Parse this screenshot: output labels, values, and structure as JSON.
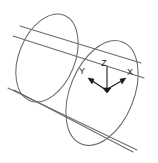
{
  "figure": {
    "background_color": "#ffffff",
    "outline_color": "#6b6b6b",
    "axis_color": "#1a1a1a",
    "width": 158,
    "height": 163
  },
  "axes": {
    "origin_label": "",
    "z": {
      "label": "Z",
      "label_x": 107,
      "label_y": 64,
      "line": {
        "x1": 107,
        "y1": 67,
        "x2": 107,
        "y2": 90
      },
      "arrow_at": "origin"
    },
    "x": {
      "label": "X",
      "label_x": 133,
      "label_y": 73,
      "line": {
        "x1": 106,
        "y1": 90,
        "x2": 124,
        "y2": 79
      },
      "arrow_at": "tip"
    },
    "y": {
      "label": "Y",
      "label_x": 80,
      "label_y": 73,
      "line": {
        "x1": 106,
        "y1": 90,
        "x2": 90,
        "y2": 80
      },
      "arrow_at": "tip"
    }
  },
  "geometry": {
    "front_ellipse": {
      "name": "front-face-ellipse",
      "cx": 102,
      "cy": 93,
      "rx": 32,
      "ry": 55,
      "rotation_deg": 22
    },
    "back_ellipse": {
      "name": "back-face-ellipse",
      "cx": 47,
      "cy": 58,
      "rx": 28,
      "ry": 46,
      "rotation_deg": 22
    },
    "rulings": [
      {
        "name": "top-ruling-outer",
        "x1": 13,
        "y1": 36,
        "x2": 144,
        "y2": 78
      },
      {
        "name": "top-ruling-inner",
        "x1": 20,
        "y1": 26,
        "x2": 141,
        "y2": 63
      },
      {
        "name": "bottom-ruling-outer",
        "x1": 8,
        "y1": 88,
        "x2": 137,
        "y2": 150
      },
      {
        "name": "bottom-ruling-inner",
        "x1": 14,
        "y1": 90,
        "x2": 133,
        "y2": 152
      }
    ]
  }
}
